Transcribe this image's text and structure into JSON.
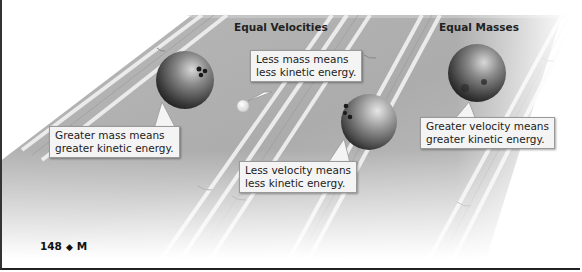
{
  "figure": {
    "headings": {
      "left": "Equal Velocities",
      "right": "Equal Masses"
    },
    "callouts": [
      {
        "id": "greater-mass",
        "lines": [
          "Greater mass means",
          "greater kinetic energy."
        ]
      },
      {
        "id": "less-mass",
        "lines": [
          "Less mass means",
          "less kinetic energy."
        ]
      },
      {
        "id": "less-velocity",
        "lines": [
          "Less velocity means",
          "less kinetic energy."
        ]
      },
      {
        "id": "greater-velocity",
        "lines": [
          "Greater velocity means",
          "greater kinetic energy."
        ]
      }
    ],
    "objects": [
      "large-bowling-ball",
      "small-ball",
      "slow-bowling-ball",
      "fast-bowling-ball"
    ]
  },
  "footer": {
    "page_number": "148",
    "separator": "◆",
    "section": "M"
  }
}
